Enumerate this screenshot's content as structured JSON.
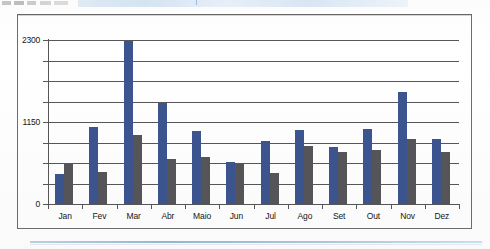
{
  "scan": {
    "top_artifact_note": "",
    "bottom_rule_note": ""
  },
  "chart_data": {
    "type": "bar",
    "title": "",
    "xlabel": "",
    "ylabel": "",
    "grid": true,
    "legend_position": "none",
    "ylim": [
      0,
      2300
    ],
    "ytick_labels": [
      "2300",
      "1150",
      "0"
    ],
    "ytick_values": [
      2300,
      1150,
      0
    ],
    "gridline_values": [
      2300,
      2012.5,
      1725,
      1437.5,
      1150,
      862.5,
      575,
      287.5,
      0
    ],
    "categories": [
      "Jan",
      "Fev",
      "Mar",
      "Abr",
      "Maio",
      "Jun",
      "Jul",
      "Ago",
      "Set",
      "Out",
      "Nov",
      "Dez"
    ],
    "series": [
      {
        "name": "Serie 1",
        "color": "#3c5590",
        "values": [
          420,
          1080,
          2290,
          1420,
          1020,
          590,
          880,
          1040,
          800,
          1050,
          1570,
          910
        ]
      },
      {
        "name": "Serie 2",
        "color": "#56565a",
        "values": [
          575,
          450,
          970,
          630,
          660,
          560,
          435,
          815,
          730,
          755,
          910,
          730
        ]
      }
    ]
  },
  "colors": {
    "primary_bar": "#3c5590",
    "secondary_bar": "#56565a",
    "axis": "#575757",
    "frame": "#6d6d6d",
    "page_background": "#ffffff"
  }
}
